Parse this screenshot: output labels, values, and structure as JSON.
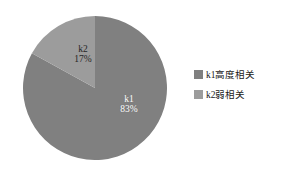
{
  "chart_data": {
    "type": "pie",
    "title": "",
    "subtitle": "",
    "xlabel": "",
    "ylabel": "",
    "grid": false,
    "legend_position": "right",
    "start_angle_deg": 0,
    "direction": "clockwise",
    "categories": [
      "k1",
      "k2"
    ],
    "values": [
      83,
      17
    ],
    "value_unit": "%",
    "slices": [
      {
        "key": "k1",
        "name": "k1",
        "percent_label": "83%",
        "value": 83,
        "sweep_deg": 298.8,
        "color": "#808080",
        "legend_label": "k1高度相关"
      },
      {
        "key": "k2",
        "name": "k2",
        "percent_label": "17%",
        "value": 17,
        "sweep_deg": 61.2,
        "color": "#9c9c9c",
        "legend_label": "k2弱相关"
      }
    ],
    "legend": [
      {
        "swatch_color": "#808080",
        "label": "k1高度相关"
      },
      {
        "swatch_color": "#9c9c9c",
        "label": "k2弱相关"
      }
    ],
    "colors": {
      "background": "#ffffff",
      "k1": "#808080",
      "k2": "#9c9c9c",
      "label_text_on_slice": "#ffffff",
      "legend_text": "#1a1a1a"
    }
  }
}
